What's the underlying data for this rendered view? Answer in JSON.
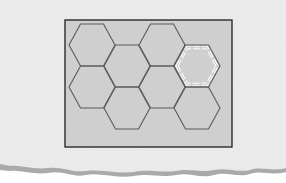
{
  "figure": {
    "colors": {
      "paper": "#ececec",
      "paper_shadow": "#a8a8a8",
      "frame_fill": "#cfcfcf",
      "frame_border": "#1e1e1e",
      "hex_stroke": "#5a5a5a",
      "highlight_stroke": "#ffffff"
    },
    "frame": {
      "x": 65,
      "y": 20,
      "width": 167,
      "height": 127
    },
    "hex_radius": 23,
    "hexes": [
      {
        "cx": 92,
        "cy": 45
      },
      {
        "cx": 92,
        "cy": 87
      },
      {
        "cx": 127,
        "cy": 66
      },
      {
        "cx": 127,
        "cy": 108
      },
      {
        "cx": 162,
        "cy": 45
      },
      {
        "cx": 162,
        "cy": 87
      },
      {
        "cx": 197,
        "cy": 108
      }
    ],
    "highlighted_hex": {
      "cx": 197,
      "cy": 66
    }
  }
}
